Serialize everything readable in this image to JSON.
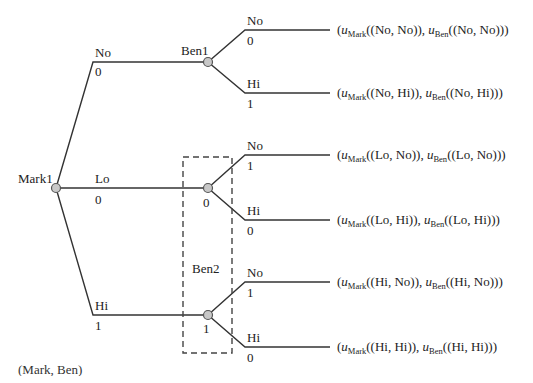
{
  "diagram": {
    "type": "extensive-form game tree",
    "caption": "(Mark, Ben)",
    "root": {
      "label": "Mark1"
    },
    "info_set_label": "Ben2",
    "mark_actions": [
      {
        "label": "No",
        "prob": "0"
      },
      {
        "label": "Lo",
        "prob": "0"
      },
      {
        "label": "Hi",
        "prob": "1"
      }
    ],
    "ben_nodes": [
      {
        "label": "Ben1",
        "node_value": ""
      },
      {
        "label": "",
        "node_value": "0"
      },
      {
        "label": "",
        "node_value": "1"
      }
    ],
    "ben_actions": [
      [
        {
          "label": "No",
          "prob": "0"
        },
        {
          "label": "Hi",
          "prob": "1"
        }
      ],
      [
        {
          "label": "No",
          "prob": "1"
        },
        {
          "label": "Hi",
          "prob": "0"
        }
      ],
      [
        {
          "label": "No",
          "prob": "1"
        },
        {
          "label": "Hi",
          "prob": "0"
        }
      ]
    ],
    "payoffs": [
      {
        "profile": "No, No",
        "text_a": "((No, No)), ",
        "text_b": "((No, No))"
      },
      {
        "profile": "No, Hi",
        "text_a": "((No, Hi)), ",
        "text_b": "((No, Hi))"
      },
      {
        "profile": "Lo, No",
        "text_a": "((Lo, No)), ",
        "text_b": "((Lo, No))"
      },
      {
        "profile": "Lo, Hi",
        "text_a": "((Lo, Hi)), ",
        "text_b": "((Lo, Hi))"
      },
      {
        "profile": "Hi, No",
        "text_a": "((Hi, No)), ",
        "text_b": "((Hi, No))"
      },
      {
        "profile": "Hi, Hi",
        "text_a": "((Hi, Hi)), ",
        "text_b": "((Hi, Hi))"
      }
    ],
    "payoff_symbols": {
      "u": "u",
      "mark_sub": "Mark",
      "ben_sub": "Ben",
      "open": "(",
      "close": ")"
    },
    "colors": {
      "line": "#333333",
      "node_fill": "#c8c8c8",
      "node_stroke": "#555555",
      "dash": "#444444"
    }
  }
}
